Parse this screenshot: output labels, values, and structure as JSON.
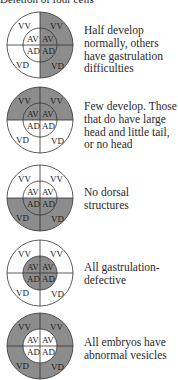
{
  "header": {
    "text": "Deletion of four cells"
  },
  "colors": {
    "shaded": "#8c8c8c",
    "outline": "#333333",
    "background": "#ffffff"
  },
  "cell_labels": {
    "outer": [
      "VV",
      "VV",
      "VD",
      "VD"
    ],
    "inner": [
      "AV",
      "AV",
      "AD",
      "AD"
    ]
  },
  "rows": [
    {
      "deleted_region": "right-half",
      "labels": {
        "vv_l": "VV",
        "vv_r": "VV",
        "av_l": "AV",
        "av_r": "AV",
        "ad_l": "AD",
        "ad_r": "AD",
        "vd_l": "VD",
        "vd_r": "VD"
      },
      "description": [
        "Half develop",
        "normally, others",
        "have gastrulation",
        "difficulties"
      ]
    },
    {
      "deleted_region": "top-half",
      "labels": {
        "vv_l": "VV",
        "vv_r": "VV",
        "av_l": "AV",
        "av_r": "AV",
        "ad_l": "AD",
        "ad_r": "AD",
        "vd_l": "VD",
        "vd_r": "VD"
      },
      "description": [
        "Few develop. Those",
        "that do have large",
        "head and little tail,",
        "or no head"
      ]
    },
    {
      "deleted_region": "bottom-half",
      "labels": {
        "vv_l": "VV",
        "vv_r": "VV",
        "av_l": "AV",
        "av_r": "AV",
        "ad_l": "AD",
        "ad_r": "AD",
        "vd_l": "VD",
        "vd_r": "VD"
      },
      "description": [
        "No dorsal",
        "structures"
      ]
    },
    {
      "deleted_region": "inner-circle",
      "labels": {
        "vv_l": "VV",
        "vv_r": "VV",
        "av_l": "AV",
        "av_r": "AV",
        "ad_l": "AD",
        "ad_r": "AD",
        "vd_l": "VD",
        "vd_r": "VD"
      },
      "description": [
        "All gastrulation-",
        "defective"
      ]
    },
    {
      "deleted_region": "outer-ring",
      "labels": {
        "vv_l": "VV",
        "vv_r": "VV",
        "av_l": "AV",
        "av_r": "AV",
        "ad_l": "AD",
        "ad_r": "AD",
        "vd_l": "VD",
        "vd_r": "VD"
      },
      "description": [
        "All embryos have",
        "abnormal vesicles"
      ]
    }
  ]
}
